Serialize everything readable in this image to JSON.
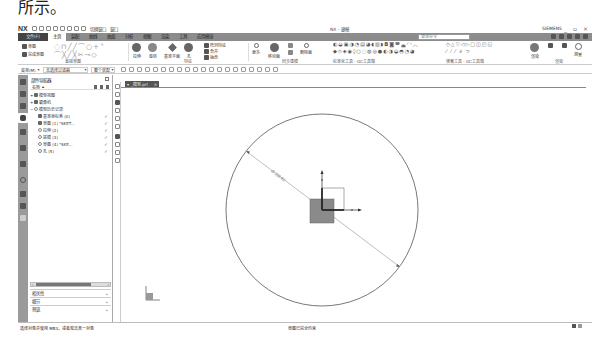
{
  "document": {
    "caption": "所示。"
  },
  "titlebar": {
    "app_logo": "NX",
    "quick_access": [
      "save-icon",
      "undo-icon",
      "redo-icon",
      "cut-icon",
      "copy-icon",
      "paste-icon",
      "repeat-icon",
      "touch-mode-icon"
    ],
    "window_menu_label": "切换窗口",
    "window_label": "窗口",
    "title": "NX - 建模",
    "user_label": "SIEMENS",
    "controls": [
      "minimize",
      "restore",
      "close"
    ]
  },
  "ribbon_tabs": {
    "file": "文件(F)",
    "tabs": [
      "主页",
      "装配",
      "曲线",
      "曲面",
      "分析",
      "视图",
      "渲染",
      "工具",
      "应用模块"
    ],
    "active_index": 0,
    "search_placeholder": "查找命令"
  },
  "ribbon": {
    "sketch_group": {
      "sketch_label": "草图",
      "finish_label": "完成草图",
      "label": "直接草图"
    },
    "feature_group": {
      "items": [
        "拉伸",
        "旋转",
        "孔",
        "基准平面",
        "阵列特征",
        "合并",
        "抽壳"
      ],
      "more_labels": [
        "更多"
      ],
      "label": "特征"
    },
    "sync_group": {
      "items": [
        "移动面",
        "偏置区域",
        "替换面",
        "删除面"
      ],
      "label": "同步建模"
    },
    "standard_group": {
      "label": "标准化工具 - GC工具箱"
    },
    "gear_group": {
      "label": "齿轮建模 - GC工具箱"
    },
    "spring_group": {
      "label": "弹簧工具 - GC工具箱"
    },
    "render_group": {
      "label": "渲染"
    },
    "analysis_group": {
      "label": "分析"
    },
    "rendering_label": "渲染",
    "measure_label": "测量"
  },
  "selection_bar": {
    "menu_label": "菜单(M)",
    "filter_label": "无选择过滤器",
    "scope_label": "整个装配"
  },
  "navigator": {
    "title": "部件导航器",
    "columns": {
      "name": "名称"
    },
    "rows": [
      {
        "label": "模型视图",
        "indent": 0,
        "check": ""
      },
      {
        "label": "摄像机",
        "indent": 0,
        "check": ""
      },
      {
        "label": "模型历史记录",
        "indent": 0,
        "check": ""
      },
      {
        "label": "基准坐标系 (0)",
        "indent": 1,
        "check": "✓"
      },
      {
        "label": "草图 (1) \"SKET...",
        "indent": 1,
        "check": "✓"
      },
      {
        "label": "拉伸 (2)",
        "indent": 1,
        "check": "✓"
      },
      {
        "label": "拔模 (3)",
        "indent": 1,
        "check": "✓"
      },
      {
        "label": "草图 (4) \"SKE...",
        "indent": 1,
        "check": "✓"
      },
      {
        "label": "孔 (5)",
        "indent": 1,
        "check": "✓"
      }
    ],
    "sections": [
      "相关性",
      "细节",
      "预览"
    ]
  },
  "graphics": {
    "tab_label": "_模型.prt",
    "dimension_text": "Ø 258.62",
    "circle": {
      "cx": 200,
      "cy": 125,
      "r": 97
    },
    "stroke_color": "#555555",
    "block_color": "#8a8a8a"
  },
  "status": {
    "left": "选择对象并使用 MB3，或者双击某一对象",
    "middle": "草图已完全约束"
  }
}
